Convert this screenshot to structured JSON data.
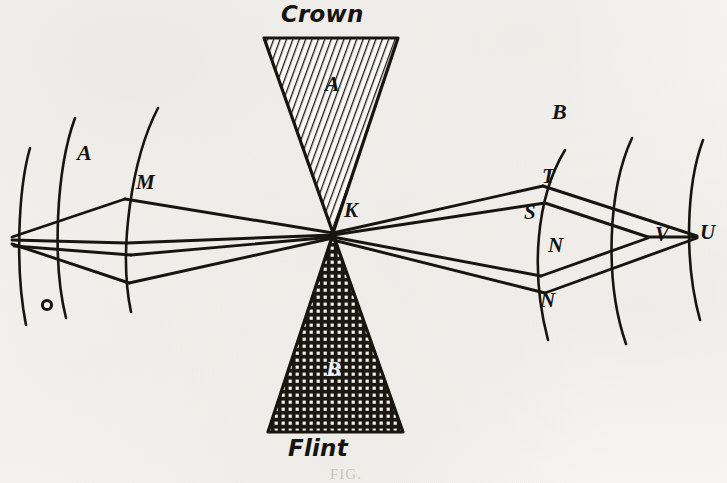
{
  "figure": {
    "caption": "FIG.",
    "ink_color": "#17150f",
    "paper_color": "#f8f7f4"
  },
  "prisms": [
    {
      "id": "crown",
      "material_label": "Crown",
      "letter": "A",
      "orientation": "apex-down",
      "hatch": "diagonal-lines",
      "apex": {
        "x": 333,
        "y": 232
      },
      "base_left": {
        "x": 264,
        "y": 38
      },
      "base_right": {
        "x": 398,
        "y": 38
      }
    },
    {
      "id": "flint",
      "material_label": "Flint",
      "letter": "B",
      "orientation": "apex-up",
      "hatch": "cross-hatch-grid",
      "apex": {
        "x": 333,
        "y": 235
      },
      "base_left": {
        "x": 268,
        "y": 432
      },
      "base_right": {
        "x": 403,
        "y": 432
      }
    }
  ],
  "point_labels": [
    {
      "name": "K",
      "text": "K",
      "x": 344,
      "y": 200
    },
    {
      "name": "M",
      "text": "M",
      "x": 136,
      "y": 172
    },
    {
      "name": "T",
      "text": "T",
      "x": 542,
      "y": 166
    },
    {
      "name": "S",
      "text": "S",
      "x": 524,
      "y": 202
    },
    {
      "name": "N-upper",
      "text": "N",
      "x": 548,
      "y": 235
    },
    {
      "name": "N-lower",
      "text": "N",
      "x": 540,
      "y": 290
    },
    {
      "name": "V",
      "text": "V",
      "x": 655,
      "y": 224
    },
    {
      "name": "U",
      "text": "U",
      "x": 700,
      "y": 222
    }
  ],
  "region_labels": [
    {
      "name": "region-A",
      "text": "A",
      "x": 77,
      "y": 142
    },
    {
      "name": "region-B",
      "text": "B",
      "x": 552,
      "y": 101
    }
  ],
  "material_labels": [
    {
      "name": "crown-caption",
      "text": "Crown",
      "x": 281,
      "y": 3
    },
    {
      "name": "flint-caption",
      "text": "Flint",
      "x": 288,
      "y": 437
    }
  ],
  "prism_letters": [
    {
      "name": "crown-letter",
      "text": "A",
      "x": 325,
      "y": 73
    },
    {
      "name": "flint-letter",
      "text": "B",
      "x": 326,
      "y": 358
    }
  ],
  "optics": {
    "vertex_K": {
      "x": 333,
      "y": 233
    },
    "source_point": {
      "x": 12,
      "y": 237
    },
    "left_upper_vertex": {
      "x": 125,
      "y": 199
    },
    "left_lower_vertex": {
      "x": 129,
      "y": 283
    },
    "focus_V": {
      "x": 648,
      "y": 237
    },
    "focus_U": {
      "x": 697,
      "y": 236
    },
    "wavefront_arcs_left": 3,
    "wavefront_arcs_right": 3,
    "ray_count_left": 4,
    "ray_count_right": 4
  }
}
